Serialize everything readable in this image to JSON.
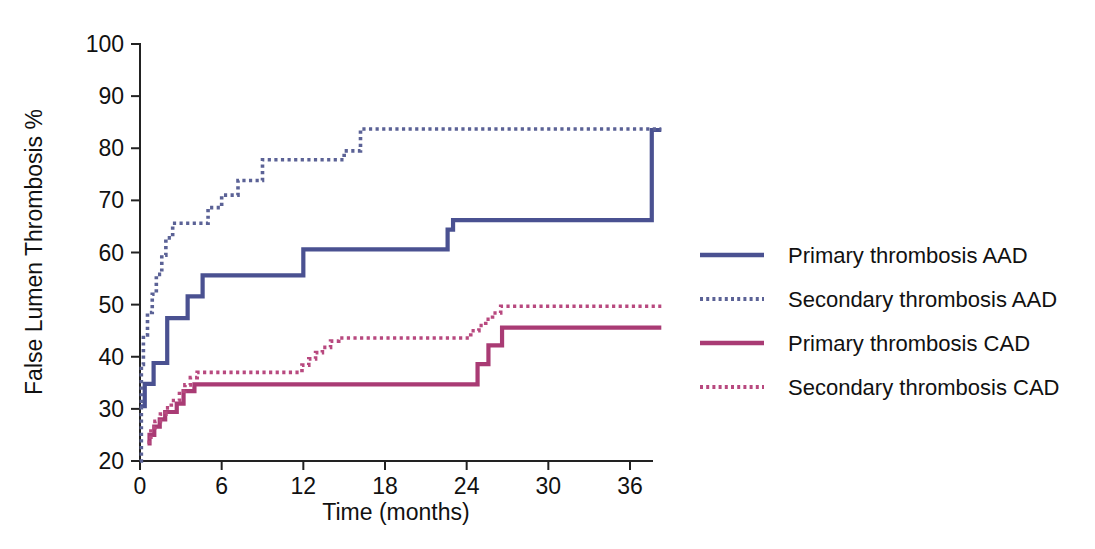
{
  "chart_data": {
    "type": "line",
    "title": "",
    "xlabel": "Time (months)",
    "ylabel": "False Lumen Thrombosis %",
    "xlim": [
      0,
      38.5
    ],
    "ylim": [
      20,
      100
    ],
    "xticks": [
      0,
      6,
      12,
      18,
      24,
      30,
      36
    ],
    "xtick_labels": [
      "0",
      "6",
      "12",
      "18",
      "24",
      "30",
      "36"
    ],
    "yticks": [
      20,
      30,
      40,
      50,
      60,
      70,
      80,
      90,
      100
    ],
    "ytick_labels": [
      "20",
      "30",
      "40",
      "50",
      "60",
      "70",
      "80",
      "90",
      "100"
    ],
    "grid": false,
    "legend_position": "right",
    "step_style": "post",
    "series": [
      {
        "name": "Primary thrombosis AAD",
        "style": "solid",
        "color": "#4a5191",
        "points": [
          [
            0.0,
            30.5
          ],
          [
            0.35,
            34.8
          ],
          [
            0.9,
            34.8
          ],
          [
            1.0,
            38.8
          ],
          [
            1.9,
            38.8
          ],
          [
            2.0,
            47.4
          ],
          [
            3.3,
            47.4
          ],
          [
            3.5,
            51.6
          ],
          [
            4.4,
            51.6
          ],
          [
            4.6,
            55.6
          ],
          [
            11.6,
            55.6
          ],
          [
            12.0,
            60.6
          ],
          [
            22.3,
            60.6
          ],
          [
            22.6,
            64.4
          ],
          [
            23.0,
            66.2
          ],
          [
            35.6,
            66.2
          ],
          [
            37.6,
            83.5
          ],
          [
            38.3,
            83.5
          ]
        ]
      },
      {
        "name": "Secondary thrombosis AAD",
        "style": "dotted",
        "color": "#5b6296",
        "points": [
          [
            0.0,
            20.0
          ],
          [
            0.1,
            38.5
          ],
          [
            0.25,
            44.2
          ],
          [
            0.55,
            48.5
          ],
          [
            0.9,
            52.0
          ],
          [
            1.2,
            55.8
          ],
          [
            1.6,
            59.5
          ],
          [
            1.9,
            62.8
          ],
          [
            2.4,
            65.6
          ],
          [
            4.2,
            65.6
          ],
          [
            5.0,
            68.6
          ],
          [
            6.0,
            71.0
          ],
          [
            7.2,
            73.8
          ],
          [
            8.0,
            73.8
          ],
          [
            9.0,
            77.8
          ],
          [
            14.6,
            77.8
          ],
          [
            15.0,
            79.5
          ],
          [
            16.2,
            83.7
          ],
          [
            38.3,
            83.7
          ]
        ]
      },
      {
        "name": "Primary thrombosis CAD",
        "style": "solid",
        "color": "#a93b74",
        "points": [
          [
            0.55,
            23.4
          ],
          [
            0.7,
            25.0
          ],
          [
            0.95,
            25.0
          ],
          [
            1.05,
            26.6
          ],
          [
            1.3,
            26.6
          ],
          [
            1.45,
            28.0
          ],
          [
            1.7,
            28.0
          ],
          [
            1.85,
            29.4
          ],
          [
            2.5,
            29.4
          ],
          [
            2.7,
            31.0
          ],
          [
            3.0,
            31.0
          ],
          [
            3.2,
            33.4
          ],
          [
            3.8,
            33.4
          ],
          [
            4.0,
            34.7
          ],
          [
            24.2,
            34.7
          ],
          [
            24.8,
            38.6
          ],
          [
            25.6,
            42.2
          ],
          [
            26.6,
            45.6
          ],
          [
            38.3,
            45.6
          ]
        ]
      },
      {
        "name": "Secondary thrombosis CAD",
        "style": "dotted",
        "color": "#b8497f",
        "points": [
          [
            0.55,
            23.6
          ],
          [
            0.8,
            26.4
          ],
          [
            1.1,
            27.6
          ],
          [
            1.5,
            29.0
          ],
          [
            1.9,
            30.2
          ],
          [
            2.3,
            31.6
          ],
          [
            2.6,
            31.6
          ],
          [
            2.9,
            33.4
          ],
          [
            3.3,
            34.6
          ],
          [
            3.7,
            36.0
          ],
          [
            4.2,
            37.0
          ],
          [
            11.5,
            37.0
          ],
          [
            11.9,
            38.4
          ],
          [
            12.4,
            39.6
          ],
          [
            12.9,
            40.8
          ],
          [
            13.4,
            41.8
          ],
          [
            14.0,
            43.0
          ],
          [
            14.6,
            43.6
          ],
          [
            23.8,
            43.6
          ],
          [
            24.3,
            45.0
          ],
          [
            24.9,
            46.0
          ],
          [
            25.4,
            47.2
          ],
          [
            25.9,
            48.4
          ],
          [
            26.5,
            49.7
          ],
          [
            38.3,
            49.7
          ]
        ]
      }
    ]
  },
  "legend": {
    "items": [
      {
        "label": "Primary thrombosis AAD",
        "style": "solid",
        "color": "#4a5191"
      },
      {
        "label": "Secondary thrombosis AAD",
        "style": "dotted",
        "color": "#5b6296"
      },
      {
        "label": "Primary thrombosis CAD",
        "style": "solid",
        "color": "#a93b74"
      },
      {
        "label": "Secondary thrombosis CAD",
        "style": "dotted",
        "color": "#b8497f"
      }
    ]
  },
  "colors": {
    "aad_primary": "#4a5191",
    "aad_secondary": "#5b6296",
    "cad_primary": "#a93b74",
    "cad_secondary": "#b8497f",
    "axis": "#222222",
    "background": "#ffffff"
  }
}
